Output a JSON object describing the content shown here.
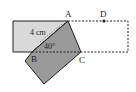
{
  "diagram": {
    "type": "geometry-fold",
    "labels": {
      "A": "A",
      "B": "B",
      "C": "C",
      "D": "D",
      "length": "4 cm",
      "angle": "40°"
    },
    "colors": {
      "light_fill": "#d9d9d9",
      "dark_fill": "#9a9a9a",
      "stroke": "#222222"
    }
  }
}
